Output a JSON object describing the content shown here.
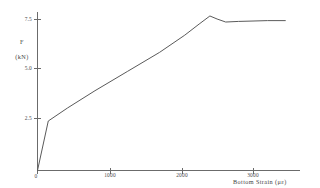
{
  "chart_data": {
    "type": "line",
    "title": "",
    "xlabel": "Bottom Strain (με)",
    "ylabel_line1": "F",
    "ylabel_line2": "(kN)",
    "xlim": [
      0,
      3400
    ],
    "ylim": [
      0,
      8.1
    ],
    "xticks": [
      0,
      1000,
      2000,
      3000
    ],
    "xticklabels": [
      "0",
      "1000",
      "2000",
      "3000"
    ],
    "yticks": [
      2.5,
      5.0,
      7.5
    ],
    "yticklabels": [
      "2.5",
      "5.0",
      "7.5"
    ],
    "grid": false,
    "legend": "none",
    "series": [
      {
        "name": "Load vs Bottom Strain",
        "color": "#5a5a5a",
        "x": [
          0,
          150,
          420,
          800,
          1250,
          1700,
          2050,
          2250,
          2400,
          2500,
          2620,
          2800,
          3000,
          3200,
          3450
        ],
        "y": [
          0.0,
          2.45,
          3.1,
          3.95,
          4.9,
          5.85,
          6.7,
          7.25,
          7.65,
          7.5,
          7.35,
          7.38,
          7.4,
          7.42,
          7.42
        ]
      }
    ],
    "annotations": [
      {
        "name": "initial-steep-branch",
        "text": "steep elastic rise from origin to knee at ~150 με / 2.45 kN"
      },
      {
        "name": "linear-hardening-branch",
        "text": "near-linear climb from knee to peak"
      },
      {
        "name": "peak-point",
        "text": "peak load 7.65 kN at ~2400 με"
      },
      {
        "name": "post-peak-plateau",
        "text": "slight drop then plateau near 7.4 kN"
      }
    ]
  },
  "axes": {
    "y_axis_name": "load-axis",
    "x_axis_name": "strain-axis"
  }
}
